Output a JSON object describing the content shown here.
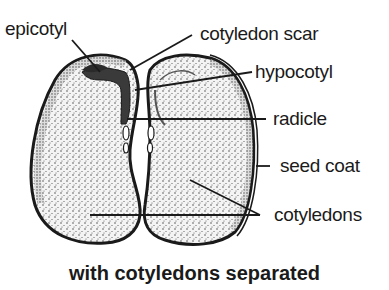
{
  "diagram": {
    "title": "with cotyledons separated",
    "labels": [
      {
        "id": "epicotyl",
        "text": "epicotyl"
      },
      {
        "id": "cotyledon-scar",
        "text": "cotyledon scar"
      },
      {
        "id": "hypocotyl",
        "text": "hypocotyl"
      },
      {
        "id": "radicle",
        "text": "radicle"
      },
      {
        "id": "seed-coat",
        "text": "seed coat"
      },
      {
        "id": "cotyledons",
        "text": "cotyledons"
      }
    ],
    "colors": {
      "ink": "#1a1a1a",
      "fill": "#f2f2f2",
      "background": "#ffffff"
    }
  }
}
